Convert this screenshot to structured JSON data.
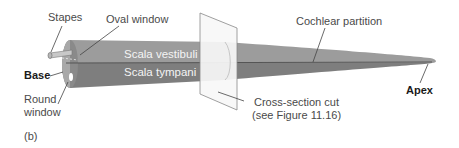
{
  "figure": {
    "panel_label": "(b)",
    "labels": {
      "stapes": "Stapes",
      "oval_window": "Oval window",
      "base": "Base",
      "round_window_line1": "Round",
      "round_window_line2": "window",
      "scala_vestibuli": "Scala vestibuli",
      "scala_tympani": "Scala tympani",
      "cochlear_partition": "Cochlear partition",
      "cross_section_line1": "Cross-section cut",
      "cross_section_line2": "(see Figure 11.16)",
      "apex": "Apex"
    },
    "colors": {
      "scala_vestibuli": "#9c9c9c",
      "scala_tympani": "#7e7e7e",
      "partition": "#555555",
      "plane": "#f7f7f7",
      "leader": "#444444"
    }
  }
}
